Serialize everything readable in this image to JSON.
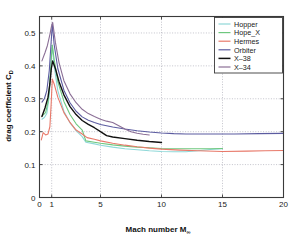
{
  "figure": {
    "background": "#ffffff",
    "axes_color": "#3a3a3a",
    "grid_color": "#9a9aa8"
  },
  "chart_data": {
    "type": "line",
    "title": "",
    "xlabel": "Mach number M",
    "xlabel_sub": "∞",
    "ylabel": "drag coefficient C",
    "ylabel_sub": "D",
    "xlim": [
      0,
      20
    ],
    "ylim": [
      0,
      0.55
    ],
    "xticks": [
      0,
      1,
      5,
      10,
      15,
      20
    ],
    "xticklabels": [
      "0",
      "1",
      "5",
      "10",
      "15",
      "20"
    ],
    "yticks": [
      0,
      0.1,
      0.2,
      0.3,
      0.4,
      0.5
    ],
    "yticklabels": [
      "0",
      "0.1",
      "0.2",
      "0.3",
      "0.4",
      "0.5"
    ],
    "grid": true,
    "grid_style": "dotted",
    "legend_position": "upper right",
    "series": [
      {
        "name": "Hopper",
        "color": "#8fd8d8",
        "width": 1.1,
        "points": [
          [
            0.2,
            0.238
          ],
          [
            0.4,
            0.243
          ],
          [
            0.6,
            0.255
          ],
          [
            0.8,
            0.31
          ],
          [
            0.95,
            0.41
          ],
          [
            1.05,
            0.462
          ],
          [
            1.2,
            0.4
          ],
          [
            1.5,
            0.325
          ],
          [
            2.0,
            0.262
          ],
          [
            2.5,
            0.227
          ],
          [
            3.0,
            0.203
          ],
          [
            3.5,
            0.185
          ],
          [
            3.8,
            0.168
          ],
          [
            4.5,
            0.163
          ],
          [
            5.0,
            0.159
          ],
          [
            6.0,
            0.153
          ],
          [
            7.0,
            0.148
          ],
          [
            8.0,
            0.145
          ],
          [
            9.0,
            0.142
          ],
          [
            10.0,
            0.14
          ],
          [
            11.0,
            0.139
          ],
          [
            12.0,
            0.139
          ],
          [
            13.0,
            0.142
          ],
          [
            14.0,
            0.146
          ],
          [
            15.0,
            0.148
          ]
        ]
      },
      {
        "name": "Hope_X",
        "color": "#6ec77e",
        "width": 1.1,
        "points": [
          [
            0.2,
            0.247
          ],
          [
            0.5,
            0.258
          ],
          [
            0.7,
            0.29
          ],
          [
            0.85,
            0.35
          ],
          [
            0.98,
            0.43
          ],
          [
            1.05,
            0.463
          ],
          [
            1.2,
            0.42
          ],
          [
            1.5,
            0.352
          ],
          [
            2.0,
            0.292
          ],
          [
            2.5,
            0.252
          ],
          [
            3.0,
            0.224
          ],
          [
            3.5,
            0.205
          ],
          [
            3.8,
            0.172
          ],
          [
            4.5,
            0.168
          ],
          [
            5.0,
            0.165
          ],
          [
            6.0,
            0.16
          ],
          [
            7.0,
            0.156
          ],
          [
            8.0,
            0.153
          ],
          [
            9.0,
            0.151
          ],
          [
            10.0,
            0.149
          ],
          [
            11.0,
            0.148
          ],
          [
            12.0,
            0.148
          ],
          [
            13.0,
            0.148
          ],
          [
            14.0,
            0.148
          ],
          [
            15.0,
            0.149
          ]
        ]
      },
      {
        "name": "Hermes",
        "color": "#e8796a",
        "width": 1.1,
        "points": [
          [
            0.15,
            0.175
          ],
          [
            0.3,
            0.197
          ],
          [
            0.5,
            0.19
          ],
          [
            0.7,
            0.193
          ],
          [
            0.85,
            0.215
          ],
          [
            0.95,
            0.28
          ],
          [
            1.05,
            0.36
          ],
          [
            1.2,
            0.345
          ],
          [
            1.5,
            0.305
          ],
          [
            2.0,
            0.258
          ],
          [
            2.5,
            0.228
          ],
          [
            3.0,
            0.205
          ],
          [
            3.5,
            0.193
          ],
          [
            3.9,
            0.182
          ],
          [
            4.5,
            0.177
          ],
          [
            5.0,
            0.172
          ],
          [
            6.0,
            0.165
          ],
          [
            7.0,
            0.159
          ],
          [
            8.0,
            0.154
          ],
          [
            9.0,
            0.15
          ],
          [
            10.0,
            0.147
          ],
          [
            11.5,
            0.144
          ],
          [
            13.0,
            0.142
          ],
          [
            15.0,
            0.14
          ],
          [
            17.0,
            0.141
          ],
          [
            18.5,
            0.142
          ],
          [
            20.0,
            0.143
          ]
        ]
      },
      {
        "name": "Orbiter",
        "color": "#5b5ba0",
        "width": 1.1,
        "points": [
          [
            0.2,
            0.29
          ],
          [
            0.4,
            0.3
          ],
          [
            0.6,
            0.325
          ],
          [
            0.8,
            0.385
          ],
          [
            0.95,
            0.47
          ],
          [
            1.05,
            0.528
          ],
          [
            1.2,
            0.465
          ],
          [
            1.5,
            0.392
          ],
          [
            2.0,
            0.326
          ],
          [
            2.5,
            0.288
          ],
          [
            3.0,
            0.262
          ],
          [
            3.5,
            0.245
          ],
          [
            4.0,
            0.235
          ],
          [
            4.5,
            0.228
          ],
          [
            5.0,
            0.222
          ],
          [
            6.0,
            0.214
          ],
          [
            7.0,
            0.208
          ],
          [
            8.0,
            0.203
          ],
          [
            9.0,
            0.199
          ],
          [
            10.0,
            0.196
          ],
          [
            11.0,
            0.194
          ],
          [
            12.0,
            0.193
          ],
          [
            14.0,
            0.193
          ],
          [
            16.0,
            0.193
          ],
          [
            18.0,
            0.194
          ],
          [
            20.0,
            0.195
          ]
        ]
      },
      {
        "name": "X–38",
        "color": "#111111",
        "width": 1.4,
        "points": [
          [
            0.2,
            0.246
          ],
          [
            0.45,
            0.272
          ],
          [
            0.7,
            0.305
          ],
          [
            0.85,
            0.345
          ],
          [
            0.97,
            0.392
          ],
          [
            1.08,
            0.415
          ],
          [
            1.3,
            0.392
          ],
          [
            1.6,
            0.352
          ],
          [
            2.0,
            0.312
          ],
          [
            2.5,
            0.276
          ],
          [
            3.0,
            0.252
          ],
          [
            3.5,
            0.234
          ],
          [
            4.0,
            0.222
          ],
          [
            4.5,
            0.212
          ],
          [
            5.0,
            0.2
          ],
          [
            5.5,
            0.188
          ],
          [
            6.0,
            0.184
          ],
          [
            7.0,
            0.179
          ],
          [
            8.0,
            0.174
          ],
          [
            9.0,
            0.17
          ],
          [
            10.0,
            0.167
          ]
        ]
      },
      {
        "name": "X–34",
        "color": "#8b6f96",
        "width": 1.1,
        "points": [
          [
            0.2,
            0.415
          ],
          [
            0.45,
            0.44
          ],
          [
            0.65,
            0.462
          ],
          [
            0.85,
            0.495
          ],
          [
            0.98,
            0.52
          ],
          [
            1.08,
            0.532
          ],
          [
            1.3,
            0.472
          ],
          [
            1.6,
            0.41
          ],
          [
            2.0,
            0.355
          ],
          [
            2.5,
            0.315
          ],
          [
            3.0,
            0.288
          ],
          [
            3.5,
            0.268
          ],
          [
            4.0,
            0.255
          ],
          [
            4.5,
            0.246
          ],
          [
            5.0,
            0.238
          ],
          [
            5.5,
            0.232
          ],
          [
            6.0,
            0.228
          ],
          [
            6.5,
            0.218
          ],
          [
            7.0,
            0.208
          ],
          [
            7.5,
            0.2
          ],
          [
            8.0,
            0.195
          ],
          [
            8.5,
            0.192
          ],
          [
            9.0,
            0.19
          ]
        ]
      }
    ]
  },
  "legend": {
    "items": [
      {
        "label": "Hopper",
        "color": "#8fd8d8"
      },
      {
        "label": "Hope_X",
        "color": "#6ec77e"
      },
      {
        "label": "Hermes",
        "color": "#e8796a"
      },
      {
        "label": "Orbiter",
        "color": "#5b5ba0"
      },
      {
        "label": "X–38",
        "color": "#111111"
      },
      {
        "label": "X–34",
        "color": "#8b6f96"
      }
    ]
  }
}
